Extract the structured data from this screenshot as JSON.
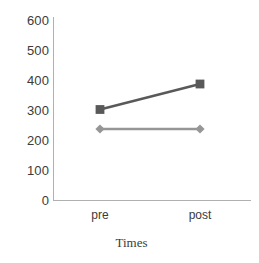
{
  "chart_data": {
    "type": "line",
    "title": "",
    "xlabel": "Times",
    "ylabel": "",
    "categories": [
      "pre",
      "post"
    ],
    "x": [
      0,
      1
    ],
    "ylim": [
      0,
      600
    ],
    "yticks": [
      0,
      100,
      200,
      300,
      400,
      500,
      600
    ],
    "ytick_labels": [
      "0",
      "100",
      "200",
      "300",
      "400",
      "500",
      "600"
    ],
    "grid": false,
    "legend": "none",
    "background": "#ffffff",
    "axis_color": "#b0b0b0",
    "tick_label_color": "#3b3b3b",
    "series": [
      {
        "name": "series-1",
        "marker": "square",
        "color": "#595959",
        "values": [
          305,
          390
        ]
      },
      {
        "name": "series-2",
        "marker": "diamond",
        "color": "#969696",
        "values": [
          240,
          240
        ]
      }
    ]
  },
  "axes": {
    "y_tick_labels": [
      "600",
      "500",
      "400",
      "300",
      "200",
      "100",
      "0"
    ],
    "x_tick_labels": [
      "pre",
      "post"
    ],
    "x_title": "Times"
  }
}
